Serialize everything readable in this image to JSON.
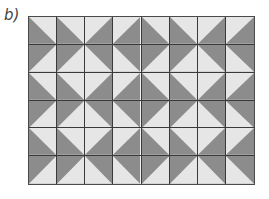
{
  "label": "b)",
  "colors": {
    "dark": "#8c8c8c",
    "light": "#e6e6e6",
    "line": "#3a3a3a"
  },
  "grid": {
    "rows": 6,
    "cols": 8,
    "legend": "each cell names the corner holding the light triangle: TR=top-right, TL=top-left, BR=bottom-right, BL=bottom-left",
    "cells": [
      [
        "TR",
        "TR",
        "TL",
        "TL",
        "TR",
        "TR",
        "TL",
        "TL"
      ],
      [
        "BR",
        "BR",
        "BL",
        "BL",
        "BR",
        "BR",
        "BL",
        "BL"
      ],
      [
        "TR",
        "TR",
        "TL",
        "TL",
        "TR",
        "TR",
        "TL",
        "TL"
      ],
      [
        "BR",
        "BR",
        "BL",
        "BL",
        "BR",
        "BR",
        "BL",
        "BL"
      ],
      [
        "TR",
        "TR",
        "TL",
        "TL",
        "TR",
        "TR",
        "TL",
        "TL"
      ],
      [
        "BR",
        "BR",
        "BL",
        "BL",
        "BR",
        "BR",
        "BL",
        "BL"
      ]
    ]
  }
}
